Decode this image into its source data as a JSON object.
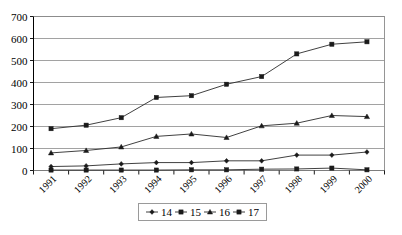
{
  "chart_data": {
    "type": "line",
    "title": "",
    "xlabel": "",
    "ylabel": "",
    "ylim": [
      0,
      700
    ],
    "ytick_step": 100,
    "ytick_labels": [
      "0",
      "100",
      "200",
      "300",
      "400",
      "500",
      "600",
      "700"
    ],
    "grid": true,
    "legend_position": "bottom",
    "categories": [
      "1991",
      "1992",
      "1993",
      "1994",
      "1995",
      "1996",
      "1997",
      "1998",
      "1999",
      "2000"
    ],
    "series": [
      {
        "name": "14",
        "marker": "diamond",
        "values": [
          18,
          21,
          30,
          36,
          36,
          44,
          44,
          70,
          70,
          84
        ]
      },
      {
        "name": "15",
        "marker": "square",
        "values": [
          190,
          206,
          240,
          332,
          340,
          392,
          427,
          530,
          574,
          585
        ]
      },
      {
        "name": "16",
        "marker": "triangle",
        "values": [
          80,
          91,
          107,
          155,
          166,
          150,
          203,
          215,
          250,
          245
        ]
      },
      {
        "name": "17",
        "marker": "square",
        "values": [
          2,
          2,
          2,
          2,
          3,
          3,
          6,
          7,
          11,
          3
        ]
      }
    ]
  },
  "legend": {
    "items": [
      {
        "label": "14"
      },
      {
        "label": "15"
      },
      {
        "label": "16"
      },
      {
        "label": "17"
      }
    ]
  },
  "colors": {
    "line": "#2b2b2b",
    "grid": "#8a8a8a",
    "axis": "#000000",
    "background": "#ffffff"
  }
}
